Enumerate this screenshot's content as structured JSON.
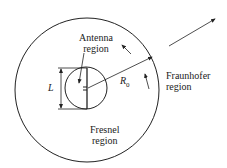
{
  "labels": {
    "antenna": [
      "Antenna",
      "region"
    ],
    "fresnel": [
      "Fresnel",
      "region"
    ],
    "fraunhofer": [
      "Fraunhofer",
      "region"
    ],
    "length": "L",
    "radius": "R",
    "radius_sub": "0"
  },
  "colors": {
    "stroke": "#222222"
  }
}
